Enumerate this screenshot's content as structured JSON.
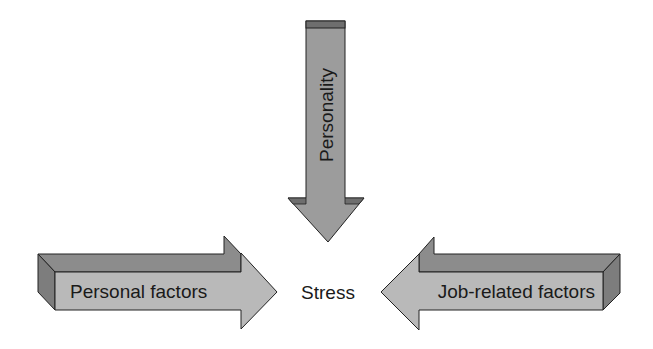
{
  "diagram": {
    "center": {
      "label": "Stress"
    },
    "arrows": [
      {
        "id": "top",
        "label": "Personality",
        "direction": "down"
      },
      {
        "id": "left",
        "label": "Personal factors",
        "direction": "right"
      },
      {
        "id": "right",
        "label": "Job-related factors",
        "direction": "left"
      }
    ]
  },
  "colors": {
    "front_face": "#b9b9b9",
    "top_face": "#8c8c8c",
    "side_face": "#7d7d7d",
    "vertical_arrow": "#9c9c9c",
    "vertical_cap": "#6e6e6e",
    "outline": "#222222"
  }
}
